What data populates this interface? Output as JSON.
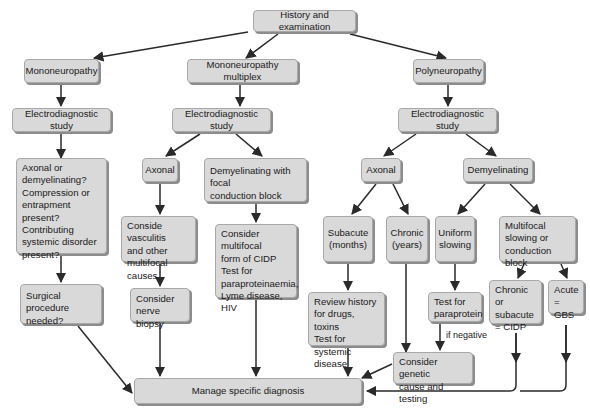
{
  "diagram": {
    "type": "flowchart",
    "colors": {
      "box_fill": "#d9d9d9",
      "box_border": "#a8a8a8",
      "shadow": "#8c8c8c",
      "arrow": "#2a2a2a"
    },
    "nodes": {
      "history": "History and examination",
      "mono": "Mononeuropathy",
      "multiplex": "Mononeuropathy  multiplex",
      "poly": "Polyneuropathy",
      "eds_mono": "Electrodiagnostic study",
      "eds_multiplex": "Electrodiagnostic study",
      "eds_poly": "Electrodiagnostic study",
      "mono_questions": "Axonal or\ndemyelinating?\nCompression or\nentrapment present?\nContributing\nsystemic disorder\npresent?",
      "surgical": "Surgical procedure\nneeded?",
      "mm_axonal": "Axonal",
      "mm_demyel": "Demyelinating with focal\nconduction block",
      "vasculitis": "Conside vasculitis\nand other\nmultifocal causes",
      "nerve_biopsy": "Consider\nnerve biopsy",
      "cidp_form": "Consider multifocal\nform of CIDP\nTest for\nparaproteinaemia,\nLyme disease, HIV",
      "p_axonal": "Axonal",
      "p_demyel": "Demyelinating",
      "subacute": "Subacute\n(months)",
      "chronic": "Chronic\n(years)",
      "uniform": "Uniform\nslowing",
      "multifocal": "Multifocal\nslowing or\nconduction block",
      "review": "Review history\nfor drugs, toxins\nTest for systemic\ndisease",
      "paraprotein": "Test for\nparaprotein",
      "chronic_cidp": "Chronic or\nsubacute\n= CIDP",
      "acute_gbs": "Acute\n= GBS",
      "genetic": "Consider genetic\ncause and testing",
      "manage": "Manage specific diagnosis"
    },
    "edge_labels": {
      "if_negative": "if negative"
    }
  }
}
